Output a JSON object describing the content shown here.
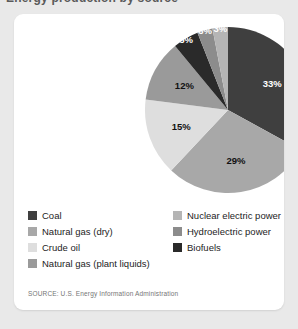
{
  "page": {
    "background_color": "#e9e9e9",
    "card_background": "#ffffff",
    "title_fragment": "Energy production by source"
  },
  "source": {
    "text": "SOURCE: U.S. Energy Information Administration"
  },
  "chart_data": {
    "type": "pie",
    "title": "Energy production by source",
    "xlabel": "",
    "ylabel": "",
    "legend_position": "bottom",
    "grid": false,
    "categories": [
      "Coal",
      "Natural gas (dry)",
      "Crude oil",
      "Natural gas (plant liquids)",
      "Nuclear electric power",
      "Hydroelectric power",
      "Biofuels"
    ],
    "values": [
      33,
      29,
      15,
      12,
      5,
      3,
      3
    ],
    "data_labels": [
      "33%",
      "29%",
      "15%",
      "12%",
      "5%",
      "3%",
      "3%"
    ],
    "colors": [
      "#3f3f3f",
      "#a8a8a8",
      "#dedede",
      "#9a9a9a",
      "#2a2a2a",
      "#8c8c8c",
      "#b5b5b5"
    ],
    "label_colors": [
      "#ffffff",
      "#111111",
      "#111111",
      "#111111",
      "#ffffff",
      "#ffffff",
      "#ffffff"
    ],
    "start_angle_deg": 0,
    "direction": "clockwise"
  },
  "legend": {
    "columns": [
      {
        "items": [
          {
            "label": "Coal",
            "color": "#3f3f3f"
          },
          {
            "label": "Natural gas (dry)",
            "color": "#a8a8a8"
          },
          {
            "label": "Crude oil",
            "color": "#dedede"
          },
          {
            "label": "Natural gas (plant liquids)",
            "color": "#9a9a9a"
          }
        ]
      },
      {
        "items": [
          {
            "label": "Nuclear electric power",
            "color": "#b5b5b5"
          },
          {
            "label": "Hydroelectric power",
            "color": "#8c8c8c"
          },
          {
            "label": "Biofuels",
            "color": "#2a2a2a"
          }
        ]
      }
    ]
  }
}
